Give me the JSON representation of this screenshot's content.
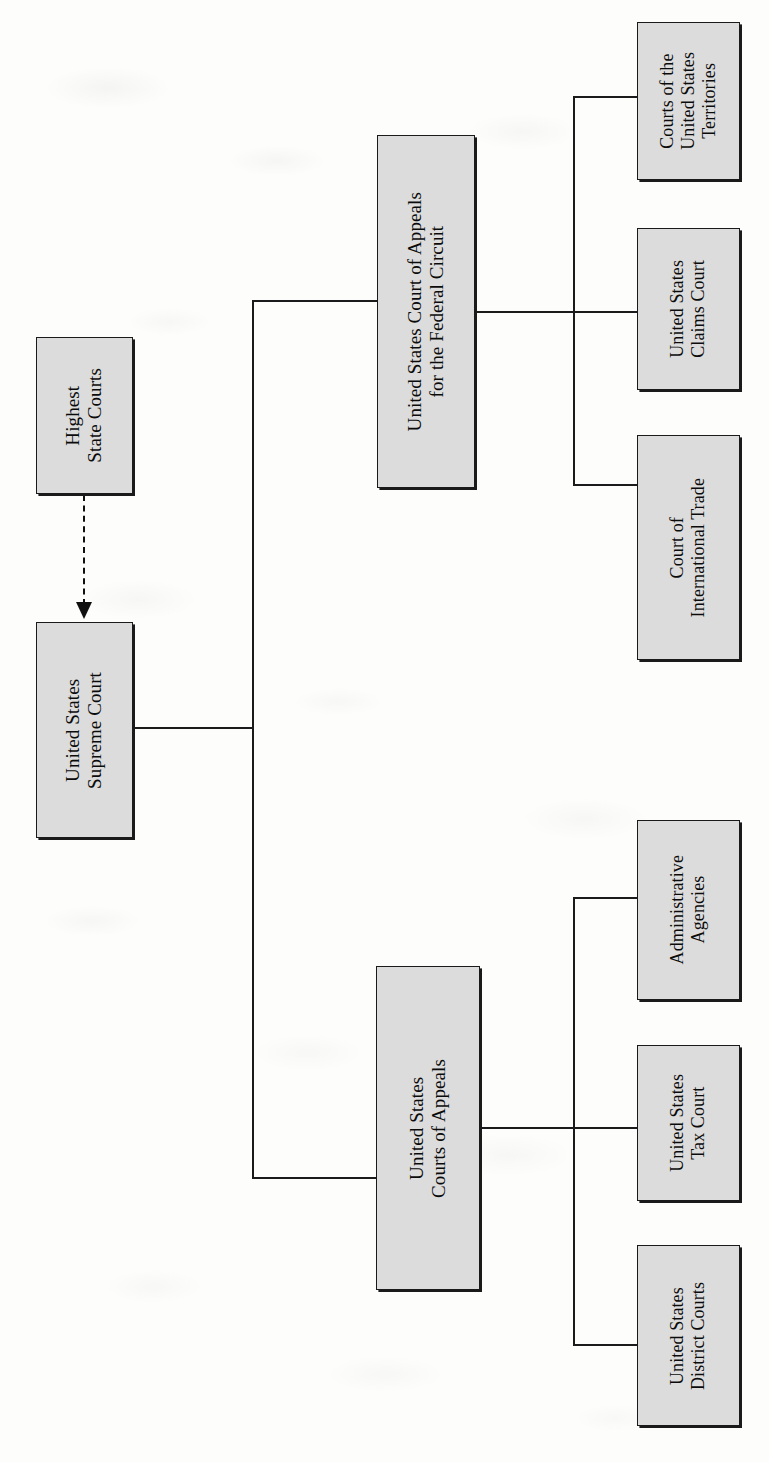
{
  "diagram": {
    "orientation": "rotated-90",
    "box_fill_color": "#dcdcdc",
    "line_color": "#1b1b1b",
    "nodes": {
      "highest_state_courts": "Highest\nState Courts",
      "us_supreme_court": "United States\nSupreme Court",
      "federal_circuit": "United States Court of Appeals\nfor the Federal Circuit",
      "us_courts_of_appeals": "United States\nCourts of Appeals",
      "territory_courts": "Courts of the\nUnited States\nTerritories",
      "claims_court": "United States\nClaims Court",
      "international_trade": "Court of\nInternational Trade",
      "administrative_agencies": "Administrative\nAgencies",
      "tax_court": "United States\nTax Court",
      "district_courts": "United States\nDistrict Courts"
    },
    "edges": [
      {
        "from": "highest_state_courts",
        "to": "us_supreme_court",
        "style": "dashed-arrow"
      },
      {
        "from": "us_supreme_court",
        "to": "federal_circuit",
        "style": "solid"
      },
      {
        "from": "us_supreme_court",
        "to": "us_courts_of_appeals",
        "style": "solid"
      },
      {
        "from": "federal_circuit",
        "to": "territory_courts",
        "style": "solid"
      },
      {
        "from": "federal_circuit",
        "to": "claims_court",
        "style": "solid"
      },
      {
        "from": "federal_circuit",
        "to": "international_trade",
        "style": "solid"
      },
      {
        "from": "us_courts_of_appeals",
        "to": "administrative_agencies",
        "style": "solid"
      },
      {
        "from": "us_courts_of_appeals",
        "to": "tax_court",
        "style": "solid"
      },
      {
        "from": "us_courts_of_appeals",
        "to": "district_courts",
        "style": "solid"
      }
    ]
  }
}
